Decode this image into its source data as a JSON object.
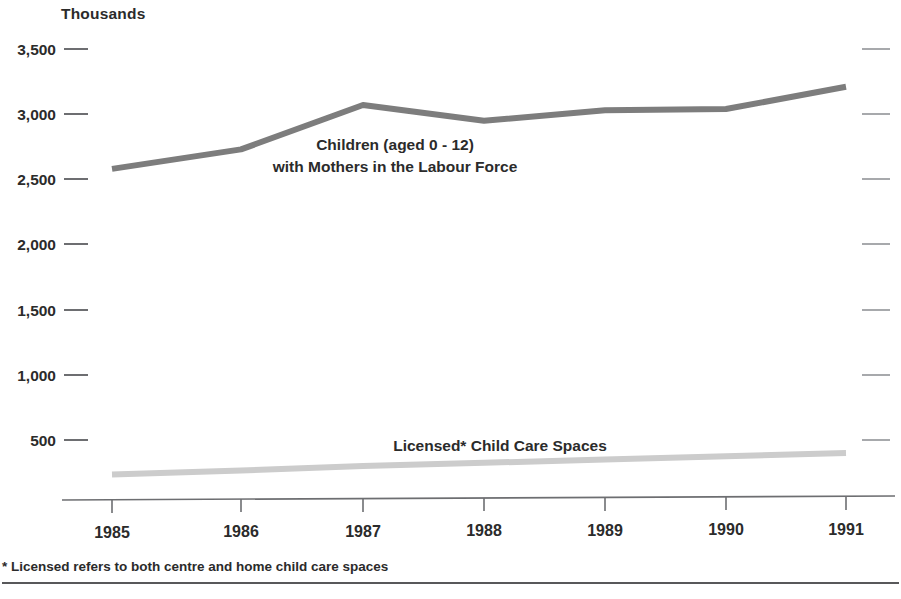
{
  "chart_data": {
    "type": "line",
    "title": "",
    "unit_label": "Thousands",
    "xlabel": "",
    "ylabel": "",
    "categories": [
      "1985",
      "1986",
      "1987",
      "1988",
      "1989",
      "1990",
      "1991"
    ],
    "x": [
      1985,
      1986,
      1987,
      1988,
      1989,
      1990,
      1991
    ],
    "ylim": [
      0,
      3500
    ],
    "xlim": [
      1985,
      1991
    ],
    "ytick_labels": [
      "3,500",
      "3,000",
      "2,500",
      "2,000",
      "1,500",
      "1,000",
      "500"
    ],
    "ytick_values": [
      3500,
      3000,
      2500,
      2000,
      1500,
      1000,
      500
    ],
    "grid": false,
    "legend_position": "inline-annotation",
    "series": [
      {
        "name": "Children (aged 0 - 12) with Mothers in the Labour Force",
        "annotation_line1": "Children (aged 0 - 12)",
        "annotation_line2": "with Mothers in the Labour Force",
        "color": "#7d7d7d",
        "values": [
          2580,
          2730,
          3070,
          2950,
          3030,
          3040,
          3210
        ]
      },
      {
        "name": "Licensed* Child Care Spaces",
        "annotation_line1": "Licensed* Child Care Spaces",
        "color": "#cccccc",
        "values": [
          235,
          265,
          300,
          325,
          350,
          375,
          400
        ]
      }
    ],
    "footnote": "* Licensed refers to both centre and home child care spaces",
    "axis_color": "#6d6e71",
    "text_color": "#2b2b2b"
  }
}
